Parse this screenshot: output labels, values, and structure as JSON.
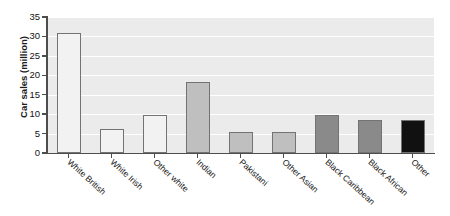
{
  "chart_data": {
    "type": "bar",
    "title": "",
    "xlabel": "",
    "ylabel": "Car sales (million)",
    "ylim": [
      0,
      35
    ],
    "yticks": [
      0,
      5,
      10,
      15,
      20,
      25,
      30,
      35
    ],
    "grid": true,
    "legend": "none",
    "categories": [
      "White British",
      "White Irish",
      "Other white",
      "Indian",
      "Pakistani",
      "Other Asian",
      "Black Caribbean",
      "Black African",
      "Other"
    ],
    "values": [
      31,
      6.2,
      9.9,
      18.2,
      5.4,
      5.4,
      9.9,
      8.6,
      8.6
    ],
    "bar_colors": [
      "#f2f2f2",
      "#f2f2f2",
      "#f2f2f2",
      "#bfbfbf",
      "#bfbfbf",
      "#bfbfbf",
      "#8a8a8a",
      "#8a8a8a",
      "#111111"
    ],
    "bar_edge_color": "#737373",
    "plot_background": "#ebebeb",
    "gridline_color": "#ffffff",
    "axis_color": "#4d4d4d"
  }
}
